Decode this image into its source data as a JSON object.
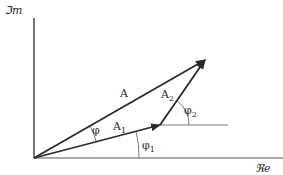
{
  "axes": {
    "imaginary_label": "ℑm",
    "real_label": "ℜe"
  },
  "vectors": {
    "resultant": {
      "label": "A"
    },
    "first": {
      "label": "A",
      "subscript": "1"
    },
    "second": {
      "label": "A",
      "subscript": "2"
    }
  },
  "angles": {
    "phi": {
      "label": "φ"
    },
    "phi1": {
      "label": "φ",
      "subscript": "1"
    },
    "phi2": {
      "label": "φ",
      "subscript": "2"
    }
  },
  "colors": {
    "stroke": "#2a2a2a",
    "thin_stroke": "#555555",
    "background": "#ffffff"
  }
}
